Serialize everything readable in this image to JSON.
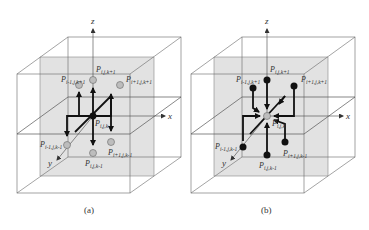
{
  "figures": [
    {
      "id": "a",
      "caption": "(a)",
      "axes": {
        "x": "x",
        "y": "y",
        "z": "z"
      },
      "center_label": {
        "base": "P",
        "sub": "i,j,k"
      },
      "point_labels": {
        "top": {
          "base": "P",
          "sub": "i,j,k+1"
        },
        "top_left": {
          "base": "P",
          "sub": "i-1,j,k+1"
        },
        "top_right": {
          "base": "P",
          "sub": "i+1,j,k+1"
        },
        "bottom": {
          "base": "P",
          "sub": "i,j,k-1"
        },
        "bottom_left": {
          "base": "P",
          "sub": "i-1,j,k-1"
        },
        "bottom_right": {
          "base": "P",
          "sub": "i+1,j,k-1"
        }
      },
      "arrow_direction": "outward from center"
    },
    {
      "id": "b",
      "caption": "(b)",
      "axes": {
        "x": "x",
        "y": "y",
        "z": "z"
      },
      "center_label": {
        "base": "P",
        "sub": "i,j,k"
      },
      "point_labels": {
        "top": {
          "base": "P",
          "sub": "i,j,k+1"
        },
        "top_left": {
          "base": "P",
          "sub": "i-1,j,k+1"
        },
        "top_right": {
          "base": "P",
          "sub": "i+1,j,k+1"
        },
        "bottom": {
          "base": "P",
          "sub": "i,j,k-1"
        },
        "bottom_left": {
          "base": "P",
          "sub": "i-1,j,k-1"
        },
        "bottom_right": {
          "base": "P",
          "sub": "i+1,j,k-1"
        }
      },
      "arrow_direction": "inward to center"
    }
  ],
  "colors": {
    "plane_fill": "#e2e2e2",
    "line": "#555555",
    "thick": "#111111",
    "open_point": "#bdbdbd",
    "solid_point": "#111111"
  }
}
